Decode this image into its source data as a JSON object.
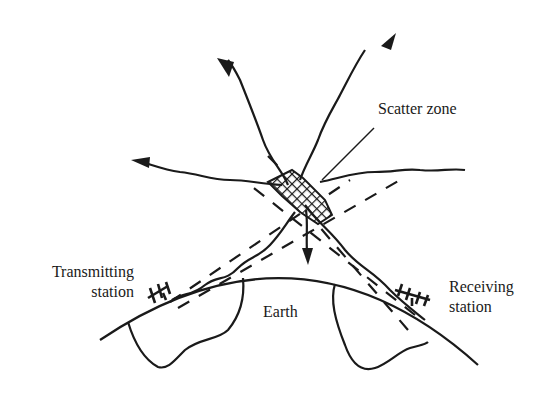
{
  "diagram": {
    "type": "tropospheric-scatter-propagation",
    "labels": {
      "scatter_zone": "Scatter zone",
      "transmitting_station_line1": "Transmitting",
      "transmitting_station_line2": "station",
      "receiving_station_line1": "Receiving",
      "receiving_station_line2": "station",
      "earth": "Earth"
    },
    "colors": {
      "ink": "#1a1a1a",
      "background": "#ffffff"
    }
  }
}
